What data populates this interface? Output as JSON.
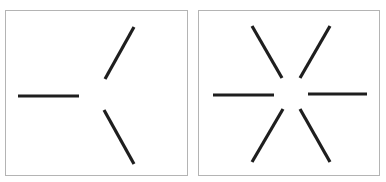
{
  "figure": {
    "background": "#ffffff",
    "panel_border_color": "#b4b4b4",
    "line_color": "#1e1e1e",
    "line_width": 3.2,
    "panels": [
      {
        "id": "left",
        "label": "three-segment-figure",
        "frame": {
          "x": 5.5,
          "y": 10.5,
          "width": 182,
          "height": 165
        },
        "segments": [
          {
            "name": "horizontal-left",
            "x1": 18,
            "y1": 96,
            "x2": 79,
            "y2": 96
          },
          {
            "name": "diagonal-upper",
            "x1": 105,
            "y1": 79,
            "x2": 134,
            "y2": 27
          },
          {
            "name": "diagonal-lower",
            "x1": 104,
            "y1": 110,
            "x2": 134,
            "y2": 164
          }
        ]
      },
      {
        "id": "right",
        "label": "six-segment-figure",
        "frame": {
          "x": 198.5,
          "y": 10.5,
          "width": 181,
          "height": 165
        },
        "segments": [
          {
            "name": "horizontal-left",
            "x1": 213,
            "y1": 95,
            "x2": 274,
            "y2": 95
          },
          {
            "name": "horizontal-right",
            "x1": 308,
            "y1": 94,
            "x2": 367,
            "y2": 94
          },
          {
            "name": "diagonal-upper-left",
            "x1": 252,
            "y1": 26,
            "x2": 282,
            "y2": 78
          },
          {
            "name": "diagonal-upper-right",
            "x1": 330,
            "y1": 26,
            "x2": 300,
            "y2": 78
          },
          {
            "name": "diagonal-lower-left",
            "x1": 283,
            "y1": 109,
            "x2": 252,
            "y2": 162
          },
          {
            "name": "diagonal-lower-right",
            "x1": 300,
            "y1": 109,
            "x2": 330,
            "y2": 162
          }
        ]
      }
    ]
  }
}
